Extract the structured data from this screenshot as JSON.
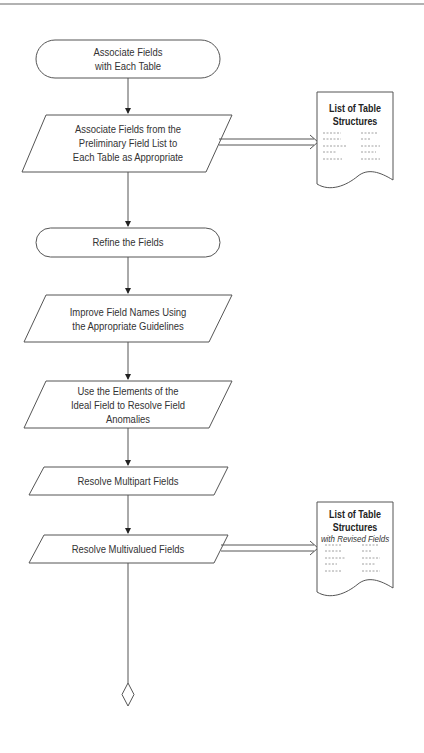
{
  "flowchart": {
    "steps": [
      {
        "type": "terminal",
        "lines": [
          "Associate Fields",
          "with Each Table"
        ]
      },
      {
        "type": "process",
        "lines": [
          "Associate Fields from the",
          "Preliminary Field List to",
          "Each Table as Appropriate"
        ]
      },
      {
        "type": "terminal",
        "lines": [
          "Refine the Fields"
        ]
      },
      {
        "type": "process",
        "lines": [
          "Improve Field Names Using",
          "the Appropriate Guidelines"
        ]
      },
      {
        "type": "process",
        "lines": [
          "Use the Elements of the",
          "Ideal Field to Resolve Field",
          "Anomalies"
        ]
      },
      {
        "type": "process",
        "lines": [
          "Resolve Multipart Fields"
        ]
      },
      {
        "type": "process",
        "lines": [
          "Resolve Multivalued Fields"
        ]
      }
    ],
    "documents": [
      {
        "title_lines": [
          "List of Table",
          "Structures"
        ],
        "subtitle": ""
      },
      {
        "title_lines": [
          "List of Table",
          "Structures"
        ],
        "subtitle": "with Revised Fields"
      }
    ],
    "end_symbol": "diamond-connector"
  },
  "colors": {
    "stroke": "#555555",
    "text": "#333333",
    "background": "#ffffff"
  }
}
